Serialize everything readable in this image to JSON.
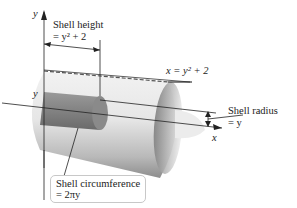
{
  "diagram": {
    "axes": {
      "y_axis_label": "y",
      "x_axis_label": "x",
      "y_level_label": "y"
    },
    "labels": {
      "shell_height": {
        "line1": "Shell height",
        "line2": "= y² + 2"
      },
      "curve": "x = y² + 2",
      "shell_radius": {
        "line1": "Shell radius",
        "line2": "= y"
      },
      "shell_circumference": {
        "line1": "Shell circumference",
        "line2": "= 2πy"
      }
    },
    "colors": {
      "shell_outer": "#d9d9d9",
      "shell_dark": "#8c8c8c",
      "inner_shell": "#6f6f6f",
      "axis": "#222222",
      "box_border": "#c8c8c8"
    }
  }
}
